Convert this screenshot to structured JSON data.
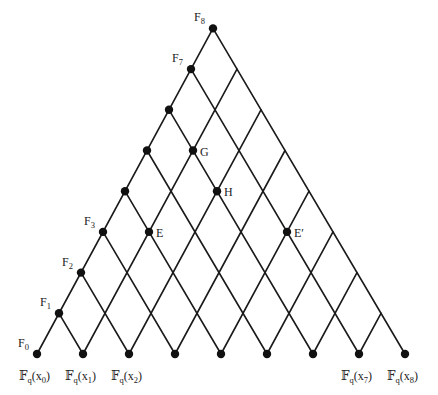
{
  "diagram": {
    "type": "triangular-lattice",
    "levels": 8,
    "geometry": {
      "origin": [
        37,
        354
      ],
      "step_up": [
        22,
        -40.7
      ],
      "step_down": [
        24,
        40.7
      ],
      "bottom_spacing": 46
    },
    "colors": {
      "line": "#1a1a1a",
      "node": "#111111",
      "text": "#222222"
    },
    "left_edge_nodes": [
      {
        "label": "F",
        "sub": "0",
        "i": 0,
        "labeled": true
      },
      {
        "label": "F",
        "sub": "1",
        "i": 1,
        "labeled": true
      },
      {
        "label": "F",
        "sub": "2",
        "i": 2,
        "labeled": true
      },
      {
        "label": "F",
        "sub": "3",
        "i": 3,
        "labeled": true
      },
      {
        "label": "",
        "sub": "",
        "i": 4,
        "labeled": false
      },
      {
        "label": "",
        "sub": "",
        "i": 5,
        "labeled": false
      },
      {
        "label": "",
        "sub": "",
        "i": 6,
        "labeled": false
      },
      {
        "label": "F",
        "sub": "7",
        "i": 7,
        "labeled": true
      },
      {
        "label": "F",
        "sub": "8",
        "i": 8,
        "labeled": true
      }
    ],
    "bottom_nodes": [
      {
        "j": 0,
        "label": "𝔽",
        "sub_q": "q",
        "var": "x",
        "sub": "0",
        "labeled": true
      },
      {
        "j": 1,
        "label": "𝔽",
        "sub_q": "q",
        "var": "x",
        "sub": "1",
        "labeled": true
      },
      {
        "j": 2,
        "label": "𝔽",
        "sub_q": "q",
        "var": "x",
        "sub": "2",
        "labeled": true
      },
      {
        "j": 3,
        "labeled": false
      },
      {
        "j": 4,
        "labeled": false
      },
      {
        "j": 5,
        "labeled": false
      },
      {
        "j": 6,
        "labeled": false
      },
      {
        "j": 7,
        "label": "𝔽",
        "sub_q": "q",
        "var": "x",
        "sub": "7",
        "labeled": true
      },
      {
        "j": 8,
        "label": "𝔽",
        "sub_q": "q",
        "var": "x",
        "sub": "8",
        "labeled": true
      }
    ],
    "interior_nodes": [
      {
        "name": "E",
        "i": 4,
        "j": 1
      },
      {
        "name": "G",
        "i": 6,
        "j": 1
      },
      {
        "name": "H",
        "i": 6,
        "j": 2
      },
      {
        "name": "E′",
        "i": 7,
        "j": 4
      }
    ]
  }
}
